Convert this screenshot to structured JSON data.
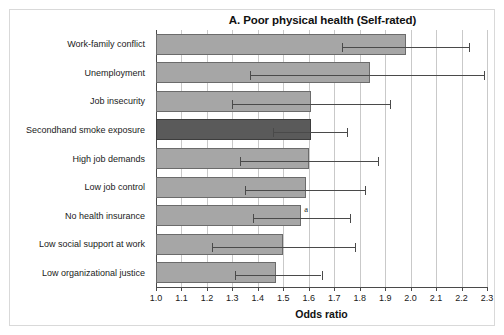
{
  "figure": {
    "title": "A. Poor physical health (Self-rated)",
    "note_marker": "a"
  },
  "chart_data": {
    "type": "bar",
    "orientation": "horizontal",
    "title": "A. Poor physical health (Self-rated)",
    "xlabel": "Odds ratio",
    "ylabel": "",
    "xlim": [
      1.0,
      2.3
    ],
    "grid": true,
    "legend": "none",
    "xticks": [
      "1.0",
      "1.1",
      "1.2",
      "1.3",
      "1.4",
      "1.5",
      "1.6",
      "1.7",
      "1.8",
      "1.9",
      "2.0",
      "2.1",
      "2.2",
      "2.3"
    ],
    "xtick_values": [
      1.0,
      1.1,
      1.2,
      1.3,
      1.4,
      1.5,
      1.6,
      1.7,
      1.8,
      1.9,
      2.0,
      2.1,
      2.2,
      2.3
    ],
    "categories": [
      "Work-family conflict",
      "Unemployment",
      "Job insecurity",
      "Secondhand smoke exposure",
      "High job demands",
      "Low job control",
      "No health insurance",
      "Low social support at work",
      "Low organizational justice"
    ],
    "values": [
      1.98,
      1.84,
      1.61,
      1.61,
      1.6,
      1.59,
      1.57,
      1.5,
      1.47
    ],
    "ci_low": [
      1.73,
      1.37,
      1.3,
      1.46,
      1.33,
      1.35,
      1.38,
      1.22,
      1.31
    ],
    "ci_high": [
      2.23,
      2.29,
      1.92,
      1.75,
      1.87,
      1.82,
      1.76,
      1.78,
      1.65
    ],
    "highlight_index": 3,
    "annotations": [
      {
        "category": "No health insurance",
        "text": "a"
      }
    ],
    "colors": {
      "bar": "#a6a6a6",
      "bar_highlight": "#5a5a5a",
      "bar_edge": "#6b6b6b",
      "error": "#4a4a4a",
      "grid": "#c9c9c9",
      "axis": "#4a4a4a",
      "text": "#1a1a1a",
      "background": "#ffffff"
    }
  }
}
